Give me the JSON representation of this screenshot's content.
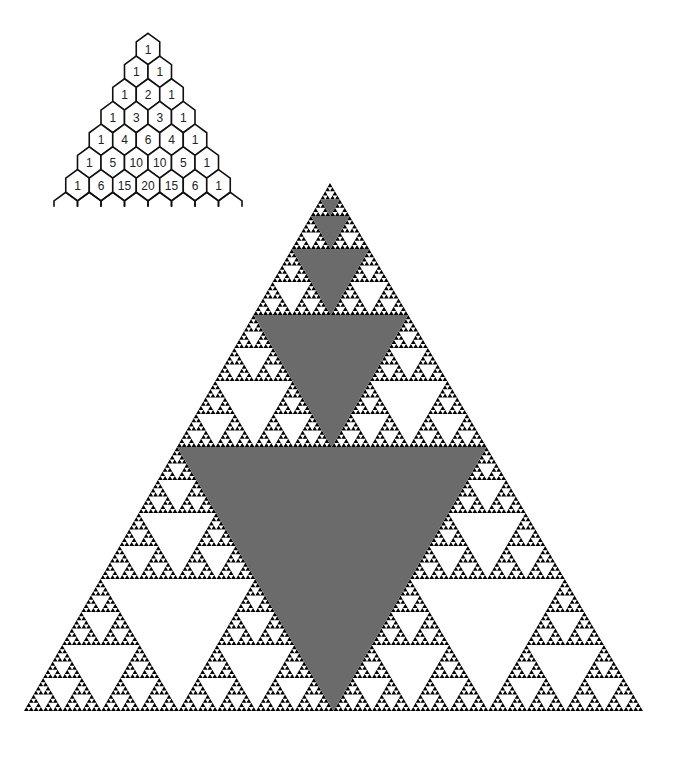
{
  "pascal_triangle": {
    "rows": [
      [
        "1"
      ],
      [
        "1",
        "1"
      ],
      [
        "1",
        "2",
        "1"
      ],
      [
        "1",
        "3",
        "3",
        "1"
      ],
      [
        "1",
        "4",
        "6",
        "4",
        "1"
      ],
      [
        "1",
        "5",
        "10",
        "10",
        "5",
        "1"
      ],
      [
        "1",
        "6",
        "15",
        "20",
        "15",
        "6",
        "1"
      ]
    ],
    "apex_center": [
      148,
      49
    ],
    "hex_width": 23.5,
    "row_height": 22.7
  },
  "sierpinski_triangle": {
    "apex": [
      330,
      183
    ],
    "base_left": [
      24,
      711
    ],
    "base_right": [
      643,
      711
    ],
    "depth": 7,
    "fill_color": "#000000",
    "highlight_color": "#6b6b6b",
    "highlighted_levels": 5
  }
}
